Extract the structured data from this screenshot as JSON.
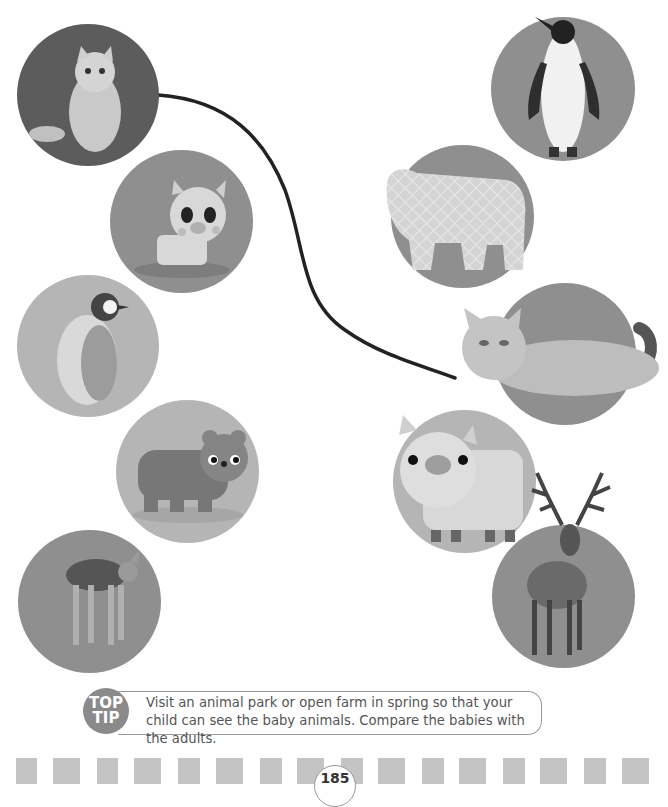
{
  "page": {
    "page_number": "185",
    "colors": {
      "circle_dark": "#5c5c5c",
      "circle_mid": "#8f8f8f",
      "circle_light": "#b7b7b7",
      "stripe": "#c4c4c4",
      "line": "#222222"
    }
  },
  "matching": {
    "left_column": [
      {
        "id": "kitten",
        "label": "kitten",
        "kind": "photo"
      },
      {
        "id": "piglet",
        "label": "piglet",
        "kind": "illustration"
      },
      {
        "id": "penguin-chick",
        "label": "penguin chick",
        "kind": "photo"
      },
      {
        "id": "bear-cub",
        "label": "bear cub",
        "kind": "illustration"
      },
      {
        "id": "fawn",
        "label": "fawn",
        "kind": "photo"
      }
    ],
    "right_column": [
      {
        "id": "penguin",
        "label": "penguin",
        "kind": "photo"
      },
      {
        "id": "bear",
        "label": "bear",
        "kind": "illustration"
      },
      {
        "id": "cat",
        "label": "cat",
        "kind": "photo"
      },
      {
        "id": "pig",
        "label": "pig",
        "kind": "illustration"
      },
      {
        "id": "stag",
        "label": "stag",
        "kind": "photo"
      }
    ],
    "connections": [
      {
        "from": "kitten",
        "to": "cat"
      }
    ]
  },
  "top_tip": {
    "badge_line1": "TOP",
    "badge_line2": "TIP",
    "text": "Visit an animal park or open farm in spring so that your child can see the baby animals. Compare the babies with the adults."
  }
}
